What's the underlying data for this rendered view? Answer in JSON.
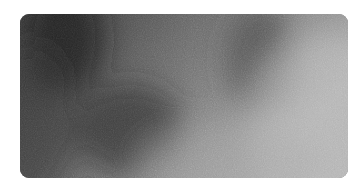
{
  "image": {
    "description": "Grainy grayscale gradient tile with rounded corners on white background",
    "background_color": "#ffffff",
    "tile": {
      "base_color": "#7a7a7a",
      "dark_color": "#2e2e2e",
      "light_color": "#b4b4b4",
      "corner_radius": 9
    },
    "blotches": [
      {
        "name": "upper-left-dark",
        "cx": 45,
        "cy": 25,
        "rx": 40,
        "ry": 55,
        "color": "#1e1e1e",
        "opacity": 0.75
      },
      {
        "name": "center-dark",
        "cx": 110,
        "cy": 115,
        "rx": 55,
        "ry": 45,
        "color": "#262626",
        "opacity": 0.6
      },
      {
        "name": "upper-right-dark",
        "cx": 240,
        "cy": 45,
        "rx": 35,
        "ry": 55,
        "color": "#3a3a3a",
        "opacity": 0.55
      },
      {
        "name": "left-edge-dark",
        "cx": 10,
        "cy": 110,
        "rx": 45,
        "ry": 80,
        "color": "#303030",
        "opacity": 0.5
      },
      {
        "name": "right-light",
        "cx": 310,
        "cy": 110,
        "rx": 80,
        "ry": 90,
        "color": "#c2c2c2",
        "opacity": 0.55
      },
      {
        "name": "bottom-mid-light",
        "cx": 210,
        "cy": 150,
        "rx": 90,
        "ry": 40,
        "color": "#a8a8a8",
        "opacity": 0.45
      }
    ]
  }
}
